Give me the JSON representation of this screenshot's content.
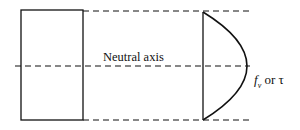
{
  "diagram": {
    "labels": {
      "neutral_axis": "Neutral axis",
      "stress_symbol": "f",
      "stress_subscript": "v",
      "stress_or": " or τ"
    },
    "shapes": {
      "section": {
        "type": "rectangle",
        "x": 21,
        "y": 10,
        "width": 62,
        "height": 110
      },
      "top_line": {
        "type": "dashed-line",
        "y": 11
      },
      "neutral_line": {
        "type": "dashed-line",
        "y": 66
      },
      "bottom_line": {
        "type": "dashed-line",
        "y": 120
      },
      "stress_profile": {
        "type": "parabola",
        "base_x": 203,
        "peak_x": 247,
        "peak_y": 66
      }
    },
    "colors": {
      "stroke": "#111111",
      "background": "#ffffff"
    }
  }
}
